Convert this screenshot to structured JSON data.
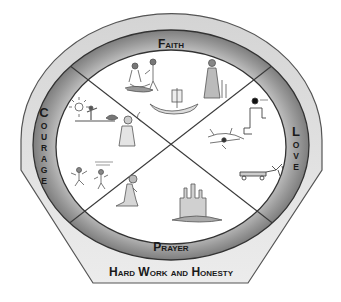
{
  "diagram": {
    "outer_band": {
      "label": "Hard Work and Honesty"
    },
    "ring_labels": {
      "top": "Faith",
      "left": "Courage",
      "right": "Love",
      "bottom": "Prayer"
    },
    "left_letters": [
      "C",
      "O",
      "U",
      "R",
      "A",
      "G",
      "E"
    ],
    "right_letters": [
      "L",
      "O",
      "V",
      "E"
    ],
    "quadrants": [
      {
        "position": "top",
        "content": "sketches of people gathering at a campfire, a woman with children, and a boat with sail"
      },
      {
        "position": "left",
        "content": "sketches of a figure under the sun, a thinking man, and two running children"
      },
      {
        "position": "right",
        "content": "sketches of a kneeling figure, a dense plant/insect drawing, and a horse-drawn wagon"
      },
      {
        "position": "bottom",
        "content": "sketches of a kneeling praying man and a castle on a rock"
      }
    ],
    "colors": {
      "outer_band": "#dcdcdc",
      "ring": "#8e8e8e",
      "ring_light": "#bdbdbd",
      "center": "#ffffff",
      "lines": "#3a3a3a",
      "text": "#1a1a1a"
    }
  }
}
